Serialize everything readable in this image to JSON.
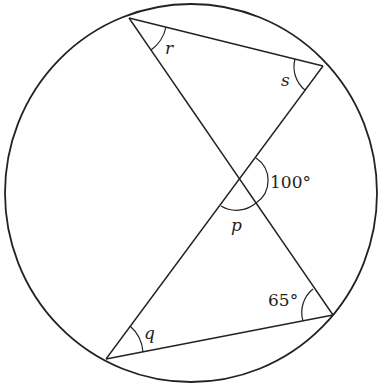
{
  "diagram": {
    "type": "circle-geometry",
    "labels": {
      "r": "r",
      "s": "s",
      "p": "p",
      "q": "q",
      "angle_100": "100°",
      "angle_65": "65°"
    },
    "colors": {
      "stroke": "#222222",
      "background": "#ffffff"
    }
  }
}
